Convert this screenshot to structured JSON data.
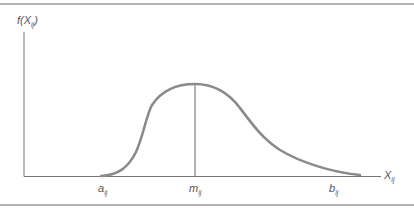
{
  "diagram": {
    "type": "probability-density-curve",
    "y_axis_label": {
      "main": "f(X",
      "sub": "ij",
      "close": ")"
    },
    "x_axis_label": {
      "main": "X",
      "sub": "ij"
    },
    "x_ticks": [
      {
        "main": "a",
        "sub": "ij"
      },
      {
        "main": "m",
        "sub": "ij"
      },
      {
        "main": "b",
        "sub": "ij"
      }
    ],
    "colors": {
      "curve": "#8a8a8a",
      "axes": "#777777",
      "rules": "#b4b4b4",
      "text": "#555555"
    }
  }
}
